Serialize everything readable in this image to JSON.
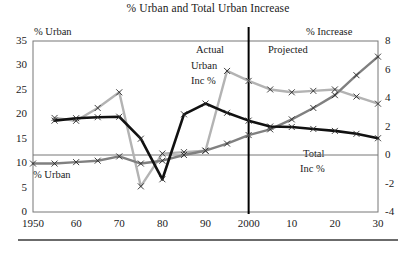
{
  "chart_data": {
    "type": "line",
    "title": "% Urban and Total Urban Increase",
    "xlabel": "",
    "ylabel": "% Urban",
    "y2label": "% Increase",
    "grid": false,
    "legend": "inline-annotations",
    "x": [
      1950,
      1955,
      1960,
      1965,
      1970,
      1975,
      1980,
      1985,
      1990,
      1995,
      2000,
      2005,
      2010,
      2015,
      2020,
      2025,
      2030
    ],
    "xticks": [
      "1950",
      "60",
      "70",
      "80",
      "90",
      "2000",
      "10",
      "20",
      "30"
    ],
    "xtick_values": [
      1950,
      1960,
      1970,
      1980,
      1990,
      2000,
      2010,
      2020,
      2030
    ],
    "ylim": [
      0,
      35
    ],
    "yticks": [
      0,
      5,
      10,
      15,
      20,
      25,
      30,
      35
    ],
    "y2lim": [
      -4,
      8
    ],
    "y2ticks": [
      -4,
      -2,
      0,
      2,
      4,
      6,
      8
    ],
    "divider_x": 2000,
    "zero_line_y2": 0,
    "series": [
      {
        "name": "% Urban",
        "axis": "left",
        "color": "#111111",
        "x": [
          1955,
          1960,
          1965,
          1970,
          1975,
          1980,
          1985,
          1990,
          1995,
          2000,
          2005,
          2010,
          2015,
          2020,
          2025,
          2030
        ],
        "values": [
          18.7,
          19.2,
          19.4,
          19.5,
          15.0,
          6.7,
          20.0,
          22.2,
          20.3,
          18.7,
          17.5,
          17.4,
          17.0,
          16.6,
          16.0,
          15.1
        ]
      },
      {
        "name": "Urban Inc %",
        "axis": "right",
        "color": "#b3b3b3",
        "x": [
          1955,
          1960,
          1965,
          1970,
          1975,
          1980,
          1985,
          1990,
          1995,
          2000,
          2005,
          2010,
          2015,
          2020,
          2025,
          2030
        ],
        "values": [
          2.6,
          2.4,
          3.3,
          4.4,
          -2.2,
          0.1,
          0.2,
          0.3,
          5.9,
          5.2,
          4.6,
          4.4,
          4.5,
          4.6,
          4.1,
          3.6
        ]
      },
      {
        "name": "Total Inc %",
        "axis": "right",
        "color": "#808080",
        "x": [
          1950,
          1955,
          1960,
          1965,
          1970,
          1975,
          1980,
          1985,
          1990,
          1995,
          2000,
          2005,
          2010,
          2015,
          2020,
          2025,
          2030
        ],
        "values": [
          -0.6,
          -0.6,
          -0.5,
          -0.4,
          -0.1,
          -0.6,
          -0.4,
          0.0,
          0.3,
          0.8,
          1.4,
          1.8,
          2.5,
          3.3,
          4.2,
          5.6,
          6.9
        ]
      }
    ],
    "annotations": [
      {
        "id": "actual",
        "text": "Actual"
      },
      {
        "id": "projected",
        "text": "Projected"
      },
      {
        "id": "urban_inc_line1",
        "text": "Urban"
      },
      {
        "id": "urban_inc_line2",
        "text": "Inc %"
      },
      {
        "id": "total_inc_line1",
        "text": "Total"
      },
      {
        "id": "total_inc_line2",
        "text": "Inc %"
      },
      {
        "id": "pct_urban_low",
        "text": "% Urban"
      }
    ]
  },
  "labels": {
    "title": "% Urban and Total Urban Increase",
    "left_axis": "% Urban",
    "right_axis": "% Increase",
    "actual": "Actual",
    "projected": "Projected",
    "urban_inc_1": "Urban",
    "urban_inc_2": "Inc %",
    "total_inc_1": "Total",
    "total_inc_2": "Inc %",
    "pct_urban_low": "% Urban"
  },
  "colors": {
    "pct_urban": "#111111",
    "urban_inc": "#b3b3b3",
    "total_inc": "#808080",
    "frame": "#777777",
    "divider": "#000000"
  }
}
